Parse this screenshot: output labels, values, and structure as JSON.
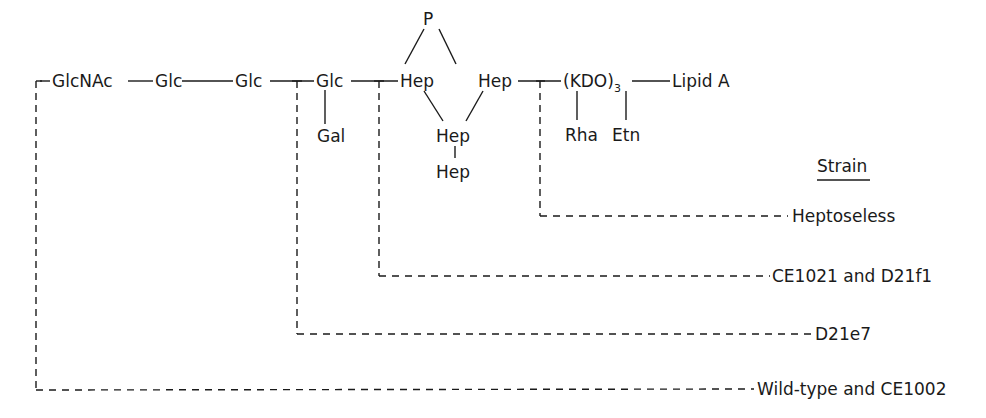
{
  "diagram": {
    "type": "lipopolysaccharide structure with mutant truncation points",
    "main_chain": [
      {
        "id": "glcnac",
        "label": "GlcNAc"
      },
      {
        "id": "glc1",
        "label": "Glc"
      },
      {
        "id": "glc2",
        "label": "Glc"
      },
      {
        "id": "glc3",
        "label": "Glc"
      },
      {
        "id": "hep1",
        "label": "Hep"
      },
      {
        "id": "hep2",
        "label": "Hep"
      },
      {
        "id": "kdo",
        "label": "(KDO)",
        "subscript": "3"
      },
      {
        "id": "lipid_a",
        "label": "Lipid A"
      }
    ],
    "branches": [
      {
        "id": "gal",
        "label": "Gal",
        "attached_to": "glc3"
      },
      {
        "id": "p",
        "label": "P",
        "attached_to": [
          "hep1",
          "hep2"
        ]
      },
      {
        "id": "hep3",
        "label": "Hep",
        "attached_to": [
          "hep1",
          "hep2"
        ]
      },
      {
        "id": "hep4",
        "label": "Hep",
        "attached_to": "hep3"
      },
      {
        "id": "rha",
        "label": "Rha",
        "attached_to": "kdo"
      },
      {
        "id": "etn",
        "label": "Etn",
        "attached_to": "kdo"
      }
    ],
    "legend_title": "Strain",
    "strains": [
      {
        "label": "Heptoseless",
        "cut_after": "hep2"
      },
      {
        "label": "CE1021 and D21f1",
        "cut_after": "glc3"
      },
      {
        "label": "D21e7",
        "cut_after": "glc2"
      },
      {
        "label": "Wild-type and CE1002",
        "cut_after": "full"
      }
    ]
  }
}
